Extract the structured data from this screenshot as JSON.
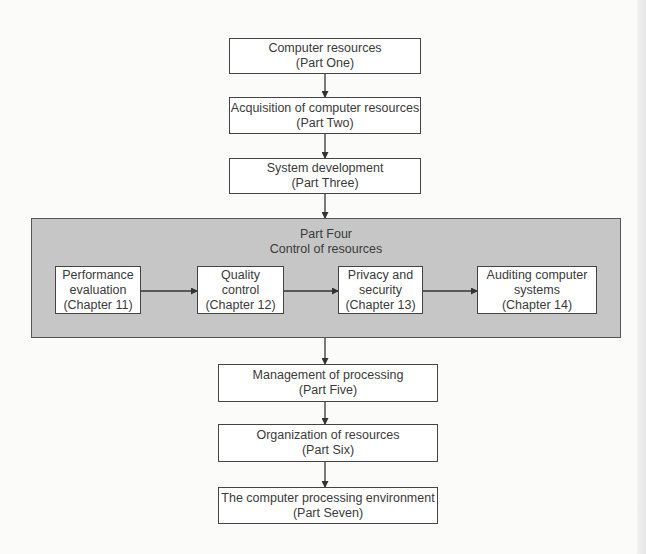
{
  "diagram": {
    "type": "flowchart",
    "colors": {
      "background": "#fbfbfa",
      "box_fill": "#ffffff",
      "box_border": "#444444",
      "panel_fill": "#c6c6c6",
      "text": "#3a3a3a"
    },
    "top_boxes": [
      {
        "title": "Computer resources",
        "subtitle": "(Part One)"
      },
      {
        "title": "Acquisition of computer resources",
        "subtitle": "(Part Two)"
      },
      {
        "title": "System development",
        "subtitle": "(Part Three)"
      }
    ],
    "panel": {
      "heading": "Part Four",
      "subheading": "Control of resources",
      "chapters": [
        {
          "line1": "Performance",
          "line2": "evaluation",
          "line3": "(Chapter 11)"
        },
        {
          "line1": "Quality",
          "line2": "control",
          "line3": "(Chapter 12)"
        },
        {
          "line1": "Privacy and",
          "line2": "security",
          "line3": "(Chapter 13)"
        },
        {
          "line1": "Auditing computer",
          "line2": "systems",
          "line3": "(Chapter 14)"
        }
      ]
    },
    "bottom_boxes": [
      {
        "title": "Management of processing",
        "subtitle": "(Part Five)"
      },
      {
        "title": "Organization of resources",
        "subtitle": "(Part Six)"
      },
      {
        "title": "The computer processing environment",
        "subtitle": "(Part Seven)"
      }
    ],
    "edges": [
      [
        "Part One",
        "Part Two"
      ],
      [
        "Part Two",
        "Part Three"
      ],
      [
        "Part Three",
        "Part Four"
      ],
      [
        "Chapter 11",
        "Chapter 12"
      ],
      [
        "Chapter 12",
        "Chapter 13"
      ],
      [
        "Chapter 13",
        "Chapter 14"
      ],
      [
        "Part Four",
        "Part Five"
      ],
      [
        "Part Five",
        "Part Six"
      ],
      [
        "Part Six",
        "Part Seven"
      ]
    ]
  }
}
